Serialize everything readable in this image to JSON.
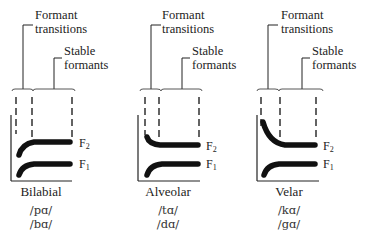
{
  "figure": {
    "type": "diagram",
    "annotations": {
      "transitions_label_line1": "Formant",
      "transitions_label_line2": "transitions",
      "stable_label_line1": "Stable",
      "stable_label_line2": "formants"
    },
    "formant_labels": {
      "f2": "F",
      "f2_sub": "2",
      "f1": "F",
      "f1_sub": "1"
    },
    "panels": [
      {
        "place": "Bilabial",
        "syllables": [
          "/pɑ/",
          "/bɑ/"
        ],
        "f2_transition": "rising",
        "f1_transition": "rising"
      },
      {
        "place": "Alveolar",
        "syllables": [
          "/tɑ/",
          "/dɑ/"
        ],
        "f2_transition": "slightly falling",
        "f1_transition": "rising"
      },
      {
        "place": "Velar",
        "syllables": [
          "/kɑ/",
          "/gɑ/"
        ],
        "f2_transition": "falling",
        "f1_transition": "rising"
      }
    ],
    "colors": {
      "ink": "#111111",
      "background": "#ffffff"
    }
  }
}
